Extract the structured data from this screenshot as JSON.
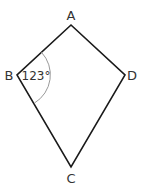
{
  "diagram": {
    "type": "kite",
    "colors": {
      "edge": "#1a1a1a",
      "arc": "#9a9a9a",
      "text": "#333333"
    },
    "vertices": [
      {
        "id": "A",
        "label": "A",
        "x": 71,
        "y": 25,
        "label_x": 71,
        "label_y": 20
      },
      {
        "id": "B",
        "label": "B",
        "x": 17,
        "y": 75,
        "label_x": 9,
        "label_y": 80
      },
      {
        "id": "D",
        "label": "D",
        "x": 125,
        "y": 75,
        "label_x": 132,
        "label_y": 80
      },
      {
        "id": "C",
        "label": "C",
        "x": 71,
        "y": 167,
        "label_x": 71,
        "label_y": 183
      }
    ],
    "edges": [
      [
        "A",
        "B"
      ],
      [
        "B",
        "C"
      ],
      [
        "C",
        "D"
      ],
      [
        "D",
        "A"
      ]
    ],
    "angle": {
      "vertex": "B",
      "value": "123°",
      "text_x": 36,
      "text_y": 80
    }
  }
}
